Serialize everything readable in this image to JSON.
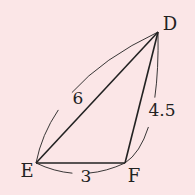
{
  "figure": {
    "type": "triangle",
    "background": "#fbe6e7",
    "line_color": "#222222",
    "vertices": [
      {
        "label": "D",
        "x": 158,
        "y": 32
      },
      {
        "label": "E",
        "x": 36,
        "y": 163
      },
      {
        "label": "F",
        "x": 125,
        "y": 163
      }
    ],
    "sides": [
      {
        "from": "E",
        "to": "D",
        "length_label": "6"
      },
      {
        "from": "F",
        "to": "D",
        "length_label": "4.5"
      },
      {
        "from": "E",
        "to": "F",
        "length_label": "3"
      }
    ]
  }
}
